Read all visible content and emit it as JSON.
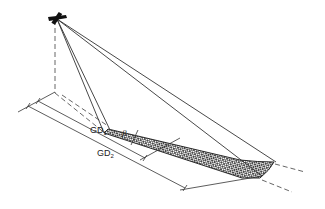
{
  "diagram": {
    "type": "oblique-geometry-sketch",
    "labels": {
      "gd1_main": "GD",
      "gd1_sub": "1",
      "gd2_main": "GD",
      "gd2_sub": "2",
      "beta": "β"
    },
    "elements": [
      {
        "name": "aircraft-icon",
        "desc": "aircraft at apex"
      },
      {
        "name": "nadir-line",
        "desc": "dashed vertical line to ground"
      },
      {
        "name": "ground-track",
        "desc": "dashed line along ground"
      },
      {
        "name": "swath",
        "desc": "cross-hatched ground strip"
      },
      {
        "name": "ray-lines",
        "desc": "lines from aircraft to swath near and far edges"
      },
      {
        "name": "dimension-gd1",
        "desc": "ground distance to near edge"
      },
      {
        "name": "dimension-gd2",
        "desc": "ground distance to far edge"
      }
    ],
    "colors": {
      "line": "#333333",
      "hatch": "#1a1a1a",
      "background": "#ffffff"
    }
  }
}
